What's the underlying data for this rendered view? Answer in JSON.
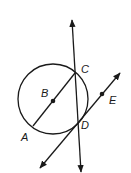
{
  "diagram": {
    "type": "geometry",
    "stroke_color": "#1a1a1a",
    "background": "#ffffff",
    "points": {
      "A": {
        "label": "A",
        "x": 33,
        "y": 126
      },
      "B": {
        "label": "B",
        "x": 53,
        "y": 101
      },
      "C": {
        "label": "C",
        "x": 75,
        "y": 73
      },
      "D": {
        "label": "D",
        "x": 78,
        "y": 123
      },
      "E": {
        "label": "E",
        "x": 102,
        "y": 94
      }
    },
    "circle": {
      "center": "B",
      "cx": 53,
      "cy": 99,
      "r": 35
    },
    "lines": [
      {
        "name": "vertical-line-through-C-D",
        "from": [
          72,
          20
        ],
        "to": [
          81,
          172
        ],
        "arrows": "both"
      },
      {
        "name": "tangent-line-through-D-E",
        "from": [
          40,
          168
        ],
        "to": [
          120,
          73
        ],
        "arrows": "both"
      },
      {
        "name": "segment-AC",
        "from": [
          33,
          126
        ],
        "to": [
          75,
          73
        ],
        "arrows": "none"
      }
    ]
  }
}
